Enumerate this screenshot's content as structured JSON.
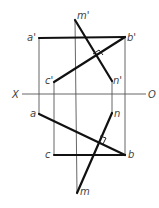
{
  "diagram": {
    "type": "orthographic-projection",
    "axis": {
      "left_label": "X",
      "right_label": "O"
    },
    "points_front": {
      "a_prime": "a'",
      "b_prime": "b'",
      "c_prime": "c'",
      "m_prime": "m'",
      "n_prime": "n'"
    },
    "points_top": {
      "a": "a",
      "b": "b",
      "c": "c",
      "m": "m",
      "n": "n"
    },
    "right_angle_marks": 2
  }
}
